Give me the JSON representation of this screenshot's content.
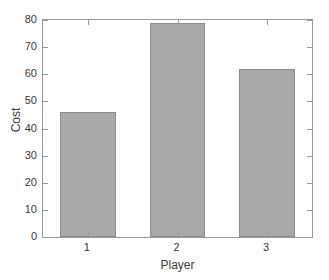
{
  "chart_data": {
    "type": "bar",
    "title": "",
    "xlabel": "Player",
    "ylabel": "Cost",
    "categories": [
      "1",
      "2",
      "3"
    ],
    "values": [
      46,
      79,
      62
    ],
    "ylim": [
      0,
      80
    ],
    "yticks": [
      0,
      10,
      20,
      30,
      40,
      50,
      60,
      70,
      80
    ],
    "ytick_labels": [
      "0",
      "10",
      "20",
      "30",
      "40",
      "50",
      "60",
      "70",
      "80"
    ],
    "xtick_labels": [
      "1",
      "2",
      "3"
    ],
    "grid": false,
    "legend": null,
    "bar_fill_color": "#a9a9a9",
    "bar_edge_color": "#8c8c8c",
    "axis_color": "#9a9a9a",
    "background_color": "#ffffff",
    "text_color": "#3a3a3a"
  }
}
